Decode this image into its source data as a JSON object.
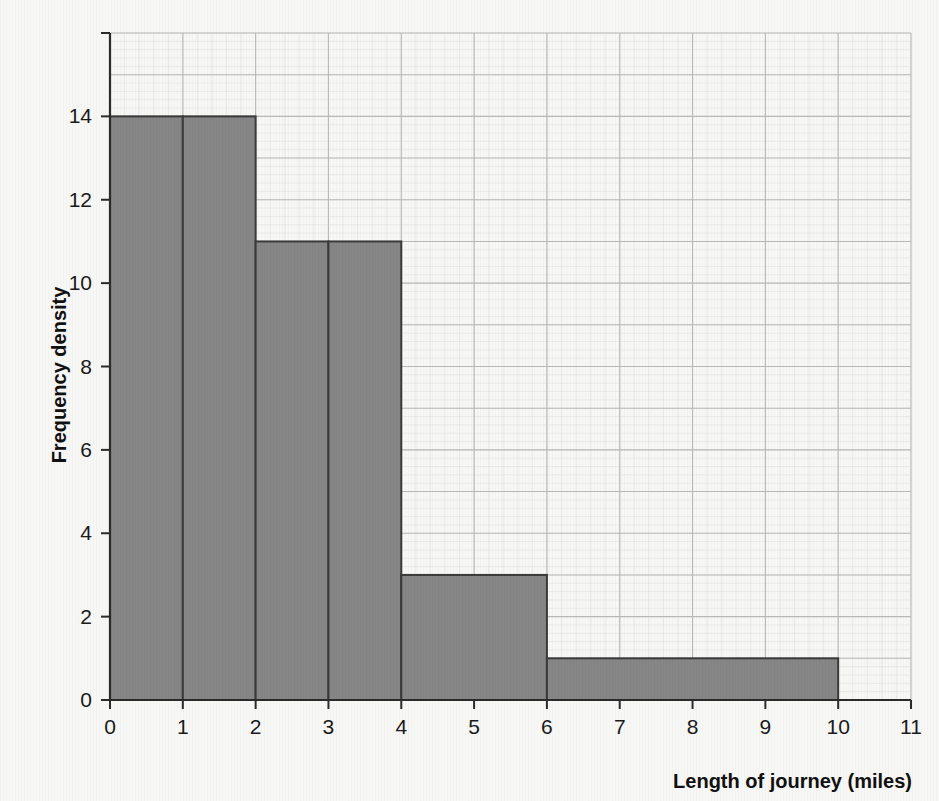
{
  "figure": {
    "background_color": "#f7f7f6",
    "bar_fill_color": "#868686",
    "bar_edge_color": "#3a3a3a",
    "grid_color": "#b9b9b9",
    "minor_grid_color": "#dcdcdc",
    "axis_color": "#2b2b2b",
    "text_color": "#1a1a1a"
  },
  "chart_data": {
    "type": "bar",
    "title": "",
    "subtitle": "",
    "xlabel": "Length of journey (miles)",
    "ylabel": "Frequency density",
    "xlim": [
      0,
      11
    ],
    "ylim": [
      0,
      16
    ],
    "xticks": [
      "0",
      "1",
      "2",
      "3",
      "4",
      "5",
      "6",
      "7",
      "8",
      "9",
      "10",
      "11"
    ],
    "xtick_values": [
      0,
      1,
      2,
      3,
      4,
      5,
      6,
      7,
      8,
      9,
      10,
      11
    ],
    "yticks": [
      "0",
      "2",
      "4",
      "6",
      "8",
      "10",
      "12",
      "14"
    ],
    "ytick_values": [
      0,
      2,
      4,
      6,
      8,
      10,
      12,
      14
    ],
    "grid": true,
    "grid_major_x_step": 1,
    "grid_major_y_step": 1,
    "legend": "none",
    "histogram": true,
    "bins": [
      {
        "label": "0-1",
        "x_start": 0,
        "x_end": 1,
        "frequency_density": 14,
        "frequency": 14
      },
      {
        "label": "1-2",
        "x_start": 1,
        "x_end": 2,
        "frequency_density": 14,
        "frequency": 14
      },
      {
        "label": "2-3",
        "x_start": 2,
        "x_end": 3,
        "frequency_density": 11,
        "frequency": 11
      },
      {
        "label": "3-4",
        "x_start": 3,
        "x_end": 4,
        "frequency_density": 11,
        "frequency": 11
      },
      {
        "label": "4-6",
        "x_start": 4,
        "x_end": 6,
        "frequency_density": 3,
        "frequency": 6
      },
      {
        "label": "6-10",
        "x_start": 6,
        "x_end": 10,
        "frequency_density": 1,
        "frequency": 4
      }
    ],
    "categories": [
      "0-1",
      "1-2",
      "2-3",
      "3-4",
      "4-6",
      "6-10"
    ],
    "values": [
      14,
      14,
      11,
      11,
      3,
      1
    ],
    "annotations": []
  }
}
